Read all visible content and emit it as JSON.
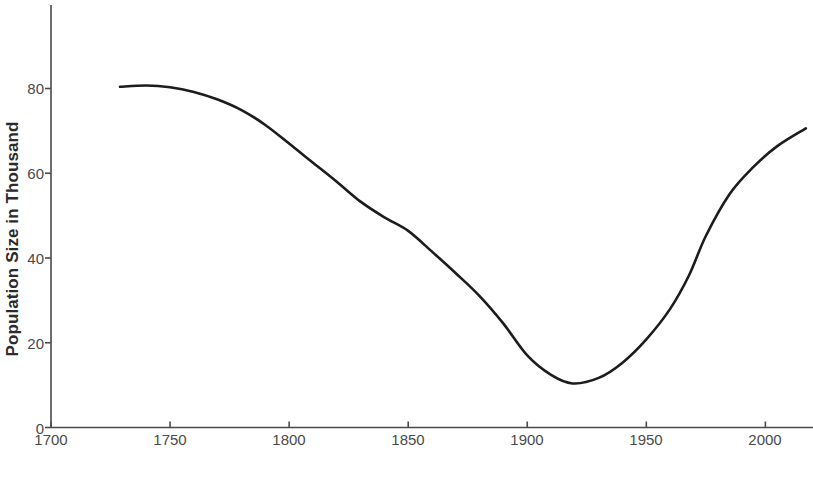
{
  "chart_data": {
    "type": "line",
    "title": "",
    "xlabel": "Year",
    "ylabel": "Population Size in Thousand",
    "xlim": [
      1700,
      2020
    ],
    "ylim": [
      0,
      100
    ],
    "x_ticks": [
      1700,
      1750,
      1800,
      1850,
      1900,
      1950,
      2000
    ],
    "x_tick_labels": [
      "1700",
      "1750",
      "1800",
      "1850",
      "1900",
      "1950",
      "2000"
    ],
    "y_ticks": [
      0,
      20,
      40,
      60,
      80
    ],
    "y_tick_labels": [
      "0",
      "20",
      "40",
      "60",
      "80"
    ],
    "grid": false,
    "legend": null,
    "line_color": "#1c1c1c",
    "line_width": 2.6,
    "series": [
      {
        "name": "Population Size",
        "x": [
          1729,
          1740,
          1750,
          1760,
          1770,
          1780,
          1790,
          1800,
          1810,
          1820,
          1830,
          1840,
          1850,
          1860,
          1870,
          1880,
          1890,
          1900,
          1910,
          1919,
          1930,
          1940,
          1950,
          1960,
          1968,
          1975,
          1985,
          1995,
          2005,
          2017
        ],
        "y": [
          80.4,
          80.7,
          80.3,
          79.2,
          77.4,
          74.9,
          71.4,
          67.0,
          62.5,
          58.0,
          53.3,
          49.6,
          46.4,
          41.5,
          36.4,
          31.0,
          24.5,
          17.0,
          12.4,
          10.4,
          11.7,
          15.3,
          20.8,
          28.0,
          36.0,
          45.2,
          55.1,
          61.5,
          66.4,
          70.6
        ]
      }
    ]
  },
  "axes": {
    "y_axis_name": "y-axis",
    "x_axis_name": "x-axis"
  }
}
